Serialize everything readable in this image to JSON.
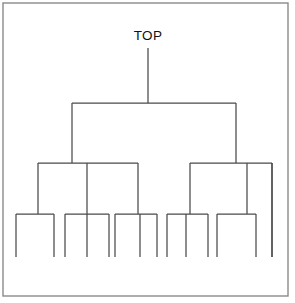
{
  "diagram": {
    "type": "hierarchical-tree",
    "title": "",
    "root_label": "TOP",
    "background_color": "#ffffff",
    "line_color": "#4a4a4a",
    "frame_color": "#8a8a8a",
    "text_color": "#111111",
    "frame": {
      "x": 3,
      "y": 3,
      "width": 285,
      "height": 293
    },
    "canvas": {
      "width": 295,
      "height": 303
    },
    "levels": 4,
    "leaf_count": 14,
    "label_position": {
      "x": 148,
      "y": 40
    },
    "geometry": {
      "root_stem": {
        "x": 148,
        "y_top": 48,
        "y_bottom": 103
      },
      "level1_bar": {
        "y": 103,
        "x_left": 72,
        "x_right": 236
      },
      "level1_drops": [
        {
          "x": 72,
          "y_top": 103,
          "y_bottom": 163
        },
        {
          "x": 236,
          "y_top": 103,
          "y_bottom": 163
        }
      ],
      "level2_bars": [
        {
          "y": 163,
          "x_left": 38,
          "x_right": 138
        },
        {
          "y": 163,
          "x_left": 190,
          "x_right": 272
        }
      ],
      "level2_drops": [
        {
          "x": 38,
          "y_top": 163,
          "y_bottom": 214
        },
        {
          "x": 87,
          "y_top": 163,
          "y_bottom": 214
        },
        {
          "x": 138,
          "y_top": 163,
          "y_bottom": 214
        },
        {
          "x": 190,
          "y_top": 163,
          "y_bottom": 214
        },
        {
          "x": 247,
          "y_top": 163,
          "y_bottom": 214
        },
        {
          "x": 272,
          "y_top": 163,
          "y_bottom": 257
        }
      ],
      "level3_bars": [
        {
          "y": 214,
          "x_left": 16,
          "x_right": 54
        },
        {
          "y": 214,
          "x_left": 65,
          "x_right": 109
        },
        {
          "y": 214,
          "x_left": 115,
          "x_right": 157
        },
        {
          "y": 214,
          "x_left": 167,
          "x_right": 208
        },
        {
          "y": 214,
          "x_left": 217,
          "x_right": 256
        }
      ],
      "leaves": [
        {
          "x": 16,
          "y_top": 214,
          "y_bottom": 257
        },
        {
          "x": 54,
          "y_top": 214,
          "y_bottom": 257
        },
        {
          "x": 65,
          "y_top": 214,
          "y_bottom": 257
        },
        {
          "x": 87,
          "y_top": 214,
          "y_bottom": 257
        },
        {
          "x": 109,
          "y_top": 214,
          "y_bottom": 257
        },
        {
          "x": 115,
          "y_top": 214,
          "y_bottom": 257
        },
        {
          "x": 140,
          "y_top": 214,
          "y_bottom": 257
        },
        {
          "x": 157,
          "y_top": 214,
          "y_bottom": 257
        },
        {
          "x": 167,
          "y_top": 214,
          "y_bottom": 257
        },
        {
          "x": 186,
          "y_top": 214,
          "y_bottom": 257
        },
        {
          "x": 208,
          "y_top": 214,
          "y_bottom": 257
        },
        {
          "x": 217,
          "y_top": 214,
          "y_bottom": 257
        },
        {
          "x": 256,
          "y_top": 214,
          "y_bottom": 257
        },
        {
          "x": 272,
          "y_top": 163,
          "y_bottom": 257
        }
      ]
    }
  }
}
